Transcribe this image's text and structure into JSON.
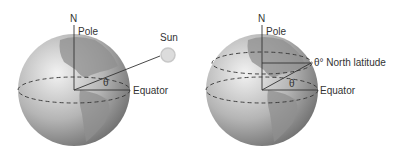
{
  "figure_left": {
    "north_label": "N",
    "pole_label": "Pole",
    "sun_label": "Sun",
    "equator_label": "Equator",
    "angle_label": "θ"
  },
  "figure_right": {
    "north_label": "N",
    "pole_label": "Pole",
    "latitude_label": "θ° North latitude",
    "equator_label": "Equator",
    "angle_label": "θ"
  },
  "colors": {
    "globe_light": "#e6e6e6",
    "globe_dark": "#6e6e6e",
    "land": "#9a9a9a",
    "line": "#333333"
  }
}
